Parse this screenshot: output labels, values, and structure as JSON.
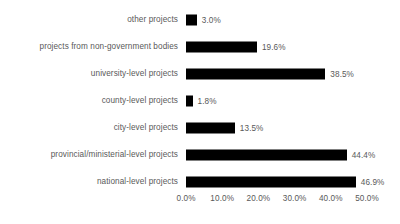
{
  "chart_data": {
    "type": "bar",
    "orientation": "horizontal",
    "title": "",
    "xlabel": "",
    "ylabel": "",
    "xlim": [
      0,
      50
    ],
    "grid": false,
    "legend": false,
    "categories": [
      "other projects",
      "projects from non-government bodies",
      "university-level projects",
      "county-level projects",
      "city-level projects",
      "provincial/ministerial-level projects",
      "national-level projects"
    ],
    "values": [
      3.0,
      19.6,
      38.5,
      1.8,
      13.5,
      44.4,
      46.9
    ],
    "value_labels": [
      "3.0%",
      "19.6%",
      "38.5%",
      "1.8%",
      "13.5%",
      "44.4%",
      "46.9%"
    ],
    "xticks": [
      0,
      10,
      20,
      30,
      40,
      50
    ],
    "xtick_labels": [
      "0.0%",
      "10.0%",
      "20.0%",
      "30.0%",
      "40.0%",
      "50.0%"
    ],
    "bar_color": "#000000",
    "text_color": "#595959",
    "background_color": "#ffffff"
  }
}
